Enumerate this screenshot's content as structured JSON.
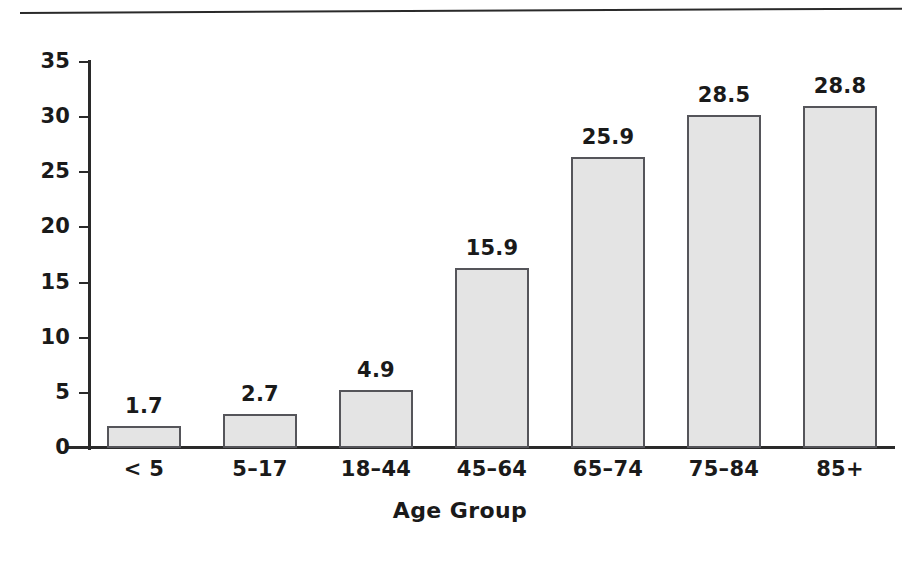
{
  "figure": {
    "background_color": "#ffffff",
    "rule_color": "#2a2a2a",
    "axis_color": "#2a2a2a",
    "bar_fill_color": "#e4e4e4",
    "bar_border_color": "#55555a",
    "text_color": "#1a1a1a"
  },
  "chart_data": {
    "type": "bar",
    "title": "",
    "subtitle": "",
    "xlabel": "Age Group",
    "ylabel": "",
    "categories": [
      "< 5",
      "5–17",
      "18–44",
      "45–64",
      "65–74",
      "75–84",
      "85+"
    ],
    "values": [
      1.7,
      2.7,
      4.9,
      15.9,
      25.9,
      28.5,
      28.8
    ],
    "value_labels": [
      "1.7",
      "2.7",
      "4.9",
      "15.9",
      "25.9",
      "28.5",
      "28.8"
    ],
    "ylim": [
      0,
      35
    ],
    "ytick_values": [
      0,
      5,
      10,
      15,
      20,
      25,
      30,
      35
    ],
    "ytick_labels": [
      "0",
      "5",
      "10",
      "15",
      "20",
      "25",
      "30",
      "35"
    ],
    "grid": false,
    "legend": null,
    "legend_position": "none",
    "annotations": [],
    "series": [
      {
        "name": "",
        "values": [
          1.7,
          2.7,
          4.9,
          15.9,
          25.9,
          28.5,
          28.8
        ]
      }
    ]
  }
}
